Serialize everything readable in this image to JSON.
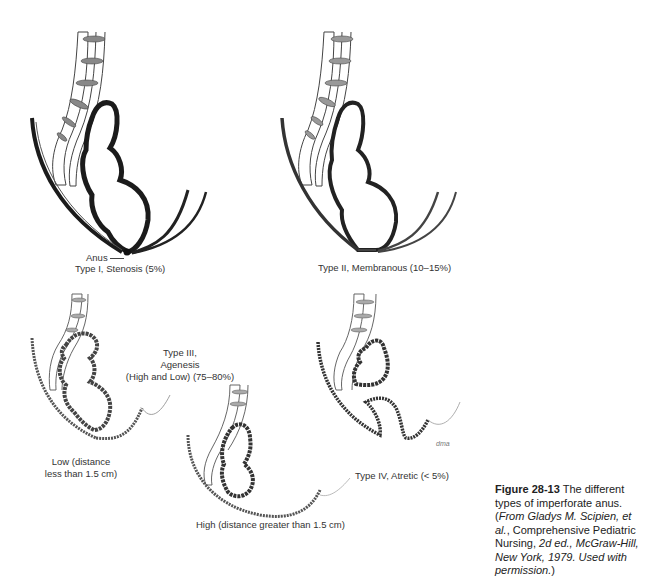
{
  "figure": {
    "panels": [
      {
        "id": "type-1",
        "title": "Type I, Stenosis (5%)",
        "annotation": "Anus"
      },
      {
        "id": "type-2",
        "title": "Type II, Membranous (10–15%)"
      },
      {
        "id": "type-3",
        "title_line1": "Type III,",
        "title_line2": "Agenesis",
        "title_line3": "(High and Low) (75–80%)",
        "low_label_line1": "Low (distance",
        "low_label_line2": "less than 1.5 cm)",
        "high_label": "High (distance greater than 1.5 cm)"
      },
      {
        "id": "type-4",
        "title": "Type IV, Atretic (< 5%)",
        "signature": "dma"
      }
    ],
    "caption": {
      "number": "Figure 28-13",
      "text_1": " The different types of imperforate anus. (",
      "source_italic": "From Gladys M. Scipien, et al.",
      "text_2": ", Comprehensive Pediatric Nursing, ",
      "edition_italic": "2d ed., McGraw-Hill, New York, 1979. Used with permission.",
      "text_3": ")"
    }
  }
}
